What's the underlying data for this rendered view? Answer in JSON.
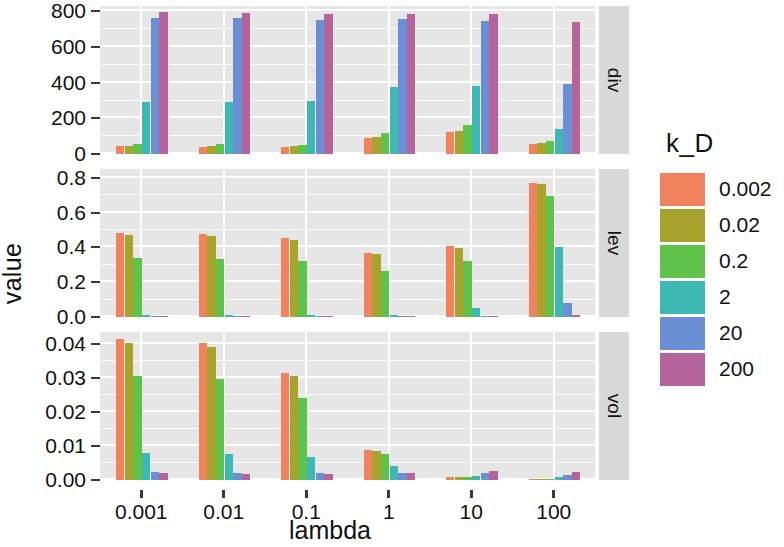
{
  "chart_data": {
    "type": "bar",
    "title": "",
    "subtitle": "",
    "xlabel": "lambda",
    "ylabel": "value",
    "grid": true,
    "legend_position": "right",
    "legend_title": "k_D",
    "categories": [
      "0.001",
      "0.01",
      "0.1",
      "1",
      "10",
      "100"
    ],
    "series_names": [
      "0.002",
      "0.02",
      "0.2",
      "2",
      "20",
      "200"
    ],
    "colors": [
      "#F1825E",
      "#A8A32C",
      "#5FC34B",
      "#3EB8B2",
      "#6B8FD4",
      "#B4639B"
    ],
    "facet_var": "metric",
    "facets": [
      {
        "name": "div",
        "ylim": [
          0,
          830
        ],
        "yticks": [
          0,
          200,
          400,
          600,
          800
        ],
        "yticklabels": [
          "0",
          "200",
          "400",
          "600",
          "800"
        ],
        "series": [
          {
            "name": "0.002",
            "values": [
              43,
              42,
              40,
              88,
              123,
              57
            ]
          },
          {
            "name": "0.02",
            "values": [
              46,
              44,
              43,
              97,
              131,
              60
            ]
          },
          {
            "name": "0.2",
            "values": [
              57,
              55,
              53,
              120,
              160,
              72
            ]
          },
          {
            "name": "2",
            "values": [
              293,
              290,
              296,
              378,
              383,
              139
            ]
          },
          {
            "name": "20",
            "values": [
              760,
              765,
              752,
              757,
              745,
              390
            ]
          },
          {
            "name": "200",
            "values": [
              795,
              790,
              788,
              788,
              785,
              742
            ]
          }
        ]
      },
      {
        "name": "lev",
        "ylim": [
          0,
          0.85
        ],
        "yticks": [
          0.0,
          0.2,
          0.4,
          0.6,
          0.8
        ],
        "yticklabels": [
          "0.0",
          "0.2",
          "0.4",
          "0.6",
          "0.8"
        ],
        "series": [
          {
            "name": "0.002",
            "values": [
              0.484,
              0.475,
              0.452,
              0.366,
              0.408,
              0.772
            ]
          },
          {
            "name": "0.02",
            "values": [
              0.471,
              0.466,
              0.443,
              0.362,
              0.398,
              0.766
            ]
          },
          {
            "name": "0.2",
            "values": [
              0.338,
              0.336,
              0.32,
              0.262,
              0.32,
              0.697
            ]
          },
          {
            "name": "2",
            "values": [
              0.01,
              0.01,
              0.01,
              0.009,
              0.054,
              0.404
            ]
          },
          {
            "name": "20",
            "values": [
              0.002,
              0.002,
              0.002,
              0.002,
              0.004,
              0.078
            ]
          },
          {
            "name": "200",
            "values": [
              0.001,
              0.001,
              0.001,
              0.001,
              0.002,
              0.01
            ]
          }
        ]
      },
      {
        "name": "vol",
        "ylim": [
          0,
          0.0435
        ],
        "yticks": [
          0.0,
          0.01,
          0.02,
          0.03,
          0.04
        ],
        "yticklabels": [
          "0.00",
          "0.01",
          "0.02",
          "0.03",
          "0.04"
        ],
        "series": [
          {
            "name": "0.002",
            "values": [
              0.0415,
              0.0403,
              0.0315,
              0.0088,
              0.0008,
              0.00018
            ]
          },
          {
            "name": "0.02",
            "values": [
              0.0402,
              0.039,
              0.0307,
              0.0086,
              0.0008,
              0.0002
            ]
          },
          {
            "name": "0.2",
            "values": [
              0.0305,
              0.0298,
              0.024,
              0.0076,
              0.0009,
              0.0003
            ]
          },
          {
            "name": "2",
            "values": [
              0.0078,
              0.0075,
              0.0068,
              0.0042,
              0.0012,
              0.00075
            ]
          },
          {
            "name": "20",
            "values": [
              0.0024,
              0.0022,
              0.002,
              0.0022,
              0.0022,
              0.0015
            ]
          },
          {
            "name": "200",
            "values": [
              0.002,
              0.0019,
              0.0018,
              0.002,
              0.0026,
              0.0023
            ]
          }
        ]
      }
    ]
  },
  "legend": {
    "title": "k_D",
    "items": [
      {
        "label": "0.002",
        "color": "#F1825E"
      },
      {
        "label": "0.02",
        "color": "#A8A32C"
      },
      {
        "label": "0.2",
        "color": "#5FC34B"
      },
      {
        "label": "2",
        "color": "#3EB8B2"
      },
      {
        "label": "20",
        "color": "#6B8FD4"
      },
      {
        "label": "200",
        "color": "#B4639B"
      }
    ]
  },
  "axes": {
    "x_title": "lambda",
    "y_title": "value",
    "x_ticklabels": [
      "0.001",
      "0.01",
      "0.1",
      "1",
      "10",
      "100"
    ]
  },
  "strips": [
    "div",
    "lev",
    "vol"
  ],
  "theme": {
    "panel_bg": "#e6e6e6",
    "grid_color": "#ffffff",
    "strip_bg": "#d9d9d9",
    "text_color": "#111111"
  }
}
